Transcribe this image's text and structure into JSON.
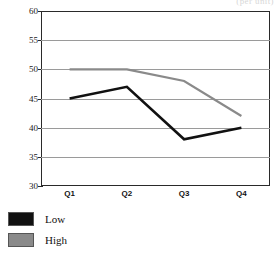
{
  "chart_data": {
    "type": "line",
    "title": "",
    "title_remnant": "(per unit)",
    "xlabel": "",
    "ylabel": "",
    "categories": [
      "Q1",
      "Q2",
      "Q3",
      "Q4"
    ],
    "series": [
      {
        "name": "Low",
        "values": [
          45,
          47,
          38,
          40
        ],
        "color": "#111111"
      },
      {
        "name": "High",
        "values": [
          50,
          50,
          48,
          42
        ],
        "color": "#8a8a8a"
      }
    ],
    "ylim": [
      30,
      60
    ],
    "ytick_step": 5,
    "yticks": [
      60,
      55,
      50,
      45,
      40,
      35,
      30
    ],
    "grid": true,
    "grid_color": "#9a9a9a",
    "legend_position": "bottom-left",
    "legend": [
      {
        "label": "Low",
        "color": "#111111"
      },
      {
        "label": "High",
        "color": "#8a8a8a"
      }
    ]
  },
  "axis": {
    "y_labels": [
      "60",
      "55",
      "50",
      "45",
      "40",
      "35",
      "30"
    ],
    "x_labels": [
      "Q1",
      "Q2",
      "Q3",
      "Q4"
    ]
  },
  "colors": {
    "frame": "#2a2a2a",
    "grid": "#9a9a9a",
    "low": "#111111",
    "high": "#8a8a8a",
    "background": "#ffffff"
  }
}
